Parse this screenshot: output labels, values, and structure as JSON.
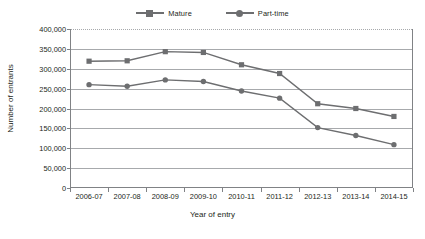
{
  "chart_data": {
    "type": "line",
    "title": "",
    "xlabel": "Year of entry",
    "ylabel": "Number of entrants",
    "categories": [
      "2006-07",
      "2007-08",
      "2008-09",
      "2009-10",
      "2010-11",
      "2011-12",
      "2012-13",
      "2013-14",
      "2014-15"
    ],
    "series": [
      {
        "name": "Mature",
        "marker": "square",
        "color": "#6d6e70",
        "values": [
          319000,
          320000,
          343000,
          341000,
          310000,
          288000,
          212000,
          200000,
          180000
        ]
      },
      {
        "name": "Part-time",
        "marker": "circle",
        "color": "#6d6e70",
        "values": [
          260000,
          256000,
          272000,
          268000,
          244000,
          226000,
          152000,
          132000,
          109000
        ]
      }
    ],
    "ylim": [
      0,
      400000
    ],
    "ytick_values": [
      0,
      50000,
      100000,
      150000,
      200000,
      250000,
      300000,
      350000,
      400000
    ],
    "ytick_labels": [
      "0",
      "50,000",
      "100,000",
      "150,000",
      "200,000",
      "250,000",
      "300,000",
      "350,000",
      "400,000"
    ],
    "grid": true,
    "legend_position": "top-center"
  },
  "legend": {
    "entries": [
      {
        "label": "Mature",
        "marker": "square"
      },
      {
        "label": "Part-time",
        "marker": "circle"
      }
    ]
  },
  "axes": {
    "y_title": "Number of entrants",
    "x_title": "Year of entry"
  },
  "colors": {
    "series": "#6d6e70",
    "gridline": "#a7a9ac",
    "axis": "#808285",
    "text": "#231f20"
  }
}
